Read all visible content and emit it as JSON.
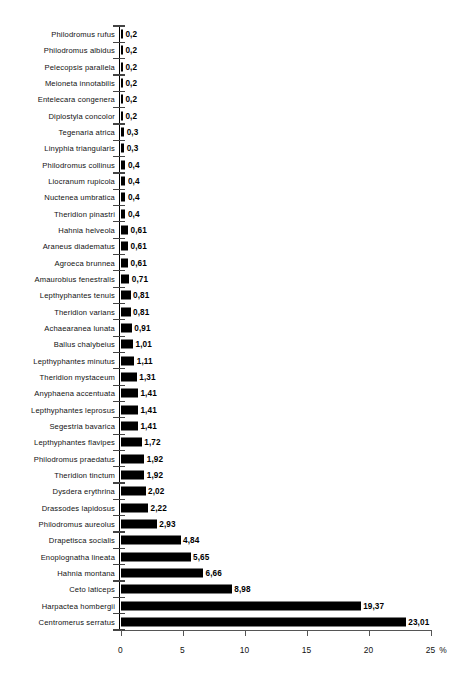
{
  "chart_data": {
    "type": "bar",
    "orientation": "horizontal",
    "title": "",
    "xlabel": "%",
    "ylabel": "",
    "xlim": [
      0,
      25
    ],
    "xticks": [
      0,
      5,
      10,
      15,
      20,
      25
    ],
    "xtick_labels": [
      "0",
      "5",
      "10",
      "15",
      "20",
      "25"
    ],
    "grid": false,
    "legend": false,
    "decimal_separator": ",",
    "bar_color": "#000000",
    "background_color": "#ffffff",
    "categories": [
      "Philodromus rufus",
      "Philodromus albidus",
      "Pelecopsis parallela",
      "Meioneta innotabilis",
      "Entelecara congenera",
      "Diplostyla concolor",
      "Tegenaria atrica",
      "Linyphia triangularis",
      "Philodromus collinus",
      "Liocranum rupicola",
      "Nuctenea umbratica",
      "Theridion pinastri",
      "Hahnia helveola",
      "Araneus diadematus",
      "Agroeca brunnea",
      "Amaurobius fenestralis",
      "Lepthyphantes tenuis",
      "Theridion varians",
      "Achaearanea lunata",
      "Ballus chalybeius",
      "Lepthyphantes minutus",
      "Theridion mystaceum",
      "Anyphaena accentuata",
      "Lepthyphantes leprosus",
      "Segestria bavarica",
      "Lepthyphantes flavipes",
      "Philodromus praedatus",
      "Theridion tinctum",
      "Dysdera erythrina",
      "Drassodes lapidosus",
      "Philodromus aureolus",
      "Drapetisca socialis",
      "Enoplognatha lineata",
      "Hahnia montana",
      "Ceto laticeps",
      "Harpactea hombergii",
      "Centromerus serratus"
    ],
    "values": [
      0.2,
      0.2,
      0.2,
      0.2,
      0.2,
      0.2,
      0.3,
      0.3,
      0.4,
      0.4,
      0.4,
      0.4,
      0.61,
      0.61,
      0.61,
      0.71,
      0.81,
      0.81,
      0.91,
      1.01,
      1.11,
      1.31,
      1.41,
      1.41,
      1.41,
      1.72,
      1.92,
      1.92,
      2.02,
      2.22,
      2.93,
      4.84,
      5.65,
      6.66,
      8.98,
      19.37,
      23.01
    ],
    "value_labels": [
      "0,2",
      "0,2",
      "0,2",
      "0,2",
      "0,2",
      "0,2",
      "0,3",
      "0,3",
      "0,4",
      "0,4",
      "0,4",
      "0,4",
      "0,61",
      "0,61",
      "0,61",
      "0,71",
      "0,81",
      "0,81",
      "0,91",
      "1,01",
      "1,11",
      "1,31",
      "1,41",
      "1,41",
      "1,41",
      "1,72",
      "1,92",
      "1,92",
      "2,02",
      "2,22",
      "2,93",
      "4,84",
      "5,65",
      "6,66",
      "8,98",
      "19,37",
      "23,01"
    ]
  }
}
